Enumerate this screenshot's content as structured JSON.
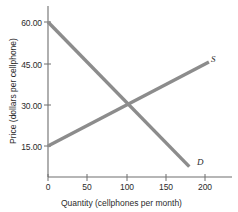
{
  "chart_data": {
    "type": "line",
    "title": "",
    "subtitle": "",
    "xlabel": "Quantity (cellphones per month)",
    "ylabel": "Price (dollars per cellphone)",
    "xlim": [
      0,
      220
    ],
    "ylim": [
      0,
      67.5
    ],
    "grid": false,
    "legend_position": "inline-end-of-line",
    "xticks": [
      "0",
      "50",
      "100",
      "150",
      "200"
    ],
    "xtick_values": [
      0,
      50,
      100,
      150,
      200
    ],
    "yticks": [
      "15.00",
      "30.00",
      "45.00",
      "60.00"
    ],
    "ytick_values": [
      15,
      30,
      45,
      60
    ],
    "series": [
      {
        "name": "S",
        "label": "S",
        "description": "Supply curve, upward sloping",
        "x": [
          0,
          205
        ],
        "y": [
          15,
          45.5
        ]
      },
      {
        "name": "D",
        "label": "D",
        "description": "Demand curve, downward sloping",
        "x": [
          0,
          180
        ],
        "y": [
          60,
          7.5
        ]
      }
    ],
    "annotations": [
      {
        "name": "equilibrium",
        "x": 100,
        "y": 30,
        "text": ""
      }
    ],
    "colors": {
      "supply_line": "#8c8c8c",
      "demand_line": "#8c8c8c",
      "axis": "#6e6e6e",
      "text": "#2b2b2b",
      "background": "#ffffff"
    }
  },
  "axes": {
    "x_title": "Quantity (cellphones per month)",
    "y_title": "Price (dollars per cellphone)",
    "x_tick_labels": [
      "0",
      "50",
      "100",
      "150",
      "200"
    ],
    "y_tick_labels": [
      "15.00",
      "30.00",
      "45.00",
      "60.00"
    ]
  },
  "curves": {
    "supply_label": "S",
    "demand_label": "D"
  }
}
